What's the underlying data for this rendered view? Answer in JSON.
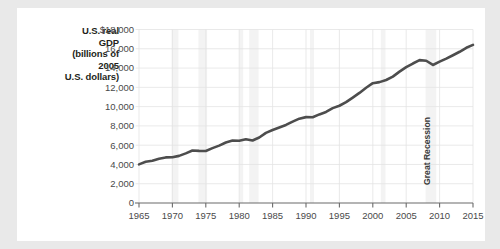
{
  "figure": {
    "background_color": "#ffffff",
    "page_background_color": "#e9e9e9",
    "y_axis_title": "U.S. real GDP (billions of 2005 U.S. dollars)",
    "y_axis_title_lines": [
      "U.S. real",
      "GDP",
      "(billions of",
      "2005",
      "U.S. dollars)"
    ]
  },
  "chart_data": {
    "type": "line",
    "title": "",
    "subtitle": "",
    "xlabel": "",
    "ylabel": "U.S. real GDP (billions of 2005 U.S. dollars)",
    "xlim": [
      1965,
      2015
    ],
    "ylim": [
      0,
      18000
    ],
    "grid": true,
    "legend_position": "none",
    "line_color": "#4d4d4d",
    "recession_band_color": "#f3f3f3",
    "x_tick_labels": [
      "1965",
      "1970",
      "1975",
      "1980",
      "1985",
      "1990",
      "1995",
      "2000",
      "2005",
      "2010",
      "2015"
    ],
    "x_ticks": [
      1965,
      1970,
      1975,
      1980,
      1985,
      1990,
      1995,
      2000,
      2005,
      2010,
      2015
    ],
    "y_tick_labels": [
      "0",
      "2,000",
      "4,000",
      "6,000",
      "8,000",
      "10,000",
      "12,000",
      "14,000",
      "16,000",
      "$18,000"
    ],
    "y_ticks": [
      0,
      2000,
      4000,
      6000,
      8000,
      10000,
      12000,
      14000,
      16000,
      18000
    ],
    "annotations": [
      {
        "text": "Great Recession",
        "x": 2008.5,
        "orientation": "vertical"
      }
    ],
    "recession_bands": [
      {
        "start": 1969.9,
        "end": 1970.9
      },
      {
        "start": 1973.9,
        "end": 1975.2
      },
      {
        "start": 1980.0,
        "end": 1980.6
      },
      {
        "start": 1981.5,
        "end": 1982.9
      },
      {
        "start": 1990.6,
        "end": 1991.2
      },
      {
        "start": 2001.2,
        "end": 2001.9
      },
      {
        "start": 2007.9,
        "end": 2009.5
      }
    ],
    "x": [
      1965,
      1966,
      1967,
      1968,
      1969,
      1970,
      1971,
      1972,
      1973,
      1974,
      1975,
      1976,
      1977,
      1978,
      1979,
      1980,
      1981,
      1982,
      1983,
      1984,
      1985,
      1986,
      1987,
      1988,
      1989,
      1990,
      1991,
      1992,
      1993,
      1994,
      1995,
      1996,
      1997,
      1998,
      1999,
      2000,
      2001,
      2002,
      2003,
      2004,
      2005,
      2006,
      2007,
      2008,
      2009,
      2010,
      2011,
      2012,
      2013,
      2014,
      2015
    ],
    "values": [
      4010,
      4270,
      4380,
      4590,
      4730,
      4740,
      4890,
      5150,
      5440,
      5410,
      5400,
      5690,
      5950,
      6280,
      6480,
      6460,
      6620,
      6490,
      6790,
      7280,
      7580,
      7840,
      8100,
      8440,
      8750,
      8910,
      8890,
      9190,
      9450,
      9840,
      10090,
      10470,
      10940,
      11420,
      11960,
      12430,
      12540,
      12760,
      13110,
      13630,
      14090,
      14470,
      14820,
      14760,
      14320,
      14660,
      14980,
      15330,
      15690,
      16100,
      16400
    ]
  }
}
